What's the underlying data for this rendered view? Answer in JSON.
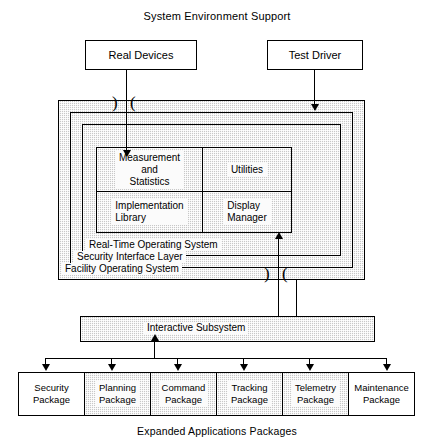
{
  "diagram": {
    "title": "System Environment Support",
    "caption": "Expanded Applications Packages",
    "top_boxes": [
      {
        "label": "Real Devices"
      },
      {
        "label": "Test Driver"
      }
    ],
    "layers": [
      {
        "name": "facility-operating-system",
        "label": "Facility Operating System"
      },
      {
        "name": "security-interface-layer",
        "label": "Security Interface Layer"
      },
      {
        "name": "real-time-operating-system",
        "label": "Real-Time Operating System"
      }
    ],
    "grid_cells": [
      {
        "name": "measurement-and-statistics",
        "label": "Measurement\nand\nStatistics"
      },
      {
        "name": "utilities",
        "label": "Utilities"
      },
      {
        "name": "implementation-library",
        "label": "Implementation\nLibrary"
      },
      {
        "name": "display-manager",
        "label": "Display\nManager"
      }
    ],
    "interactive_subsystem": {
      "label": "Interactive Subsystem"
    },
    "packages": [
      {
        "label": "Security\nPackage",
        "shaded": false
      },
      {
        "label": "Planning\nPackage",
        "shaded": true
      },
      {
        "label": "Command\nPackage",
        "shaded": true
      },
      {
        "label": "Tracking\nPackage",
        "shaded": true
      },
      {
        "label": "Telemetry\nPackage",
        "shaded": true
      },
      {
        "label": "Maintenance\nPackage",
        "shaded": false
      }
    ],
    "colors": {
      "stroke": "#000000",
      "shade_fill": "#c8c8c8",
      "background": "#ffffff"
    }
  }
}
